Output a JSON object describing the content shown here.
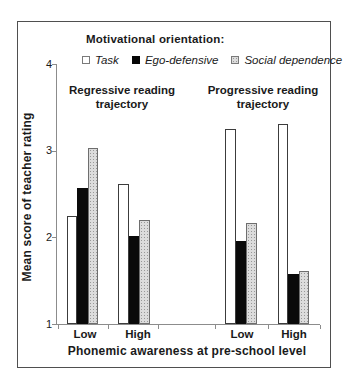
{
  "chart_data": {
    "type": "bar",
    "legend_title": "Motivational orientation:",
    "group_headers": [
      "Regressive reading trajectory",
      "Progressive reading trajectory"
    ],
    "categories": [
      "Low",
      "High",
      "Low",
      "High"
    ],
    "series": [
      {
        "name": "Task",
        "values": [
          2.25,
          2.62,
          3.25,
          3.31
        ]
      },
      {
        "name": "Ego-defensive",
        "values": [
          2.57,
          2.01,
          1.96,
          1.58
        ]
      },
      {
        "name": "Social dependence",
        "values": [
          3.03,
          2.2,
          2.17,
          1.61
        ]
      }
    ],
    "xlabel": "Phonemic awareness at pre-school level",
    "ylabel": "Mean score of teacher rating",
    "ylim": [
      1,
      4
    ],
    "yticks": [
      1,
      2,
      3,
      4
    ],
    "grid": false,
    "legend_position": "top",
    "colors": {
      "task_fill": "#ffffff",
      "ego_defensive_fill": "#0a0a0a",
      "social_dependence_fill": "#dcdcdc",
      "bar_border": "#3c3c3c",
      "axis": "#8c8c8c",
      "figure_border": "#4f4f4f",
      "text": "#1a1a1a"
    }
  }
}
